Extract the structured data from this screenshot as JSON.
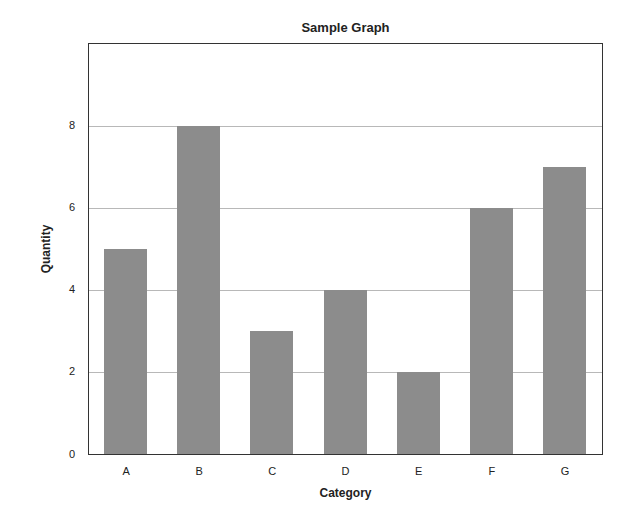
{
  "chart_data": {
    "type": "bar",
    "title": "Sample Graph",
    "xlabel": "Category",
    "ylabel": "Quantity",
    "categories": [
      "A",
      "B",
      "C",
      "D",
      "E",
      "F",
      "G"
    ],
    "values": [
      5,
      8,
      3,
      4,
      2,
      6,
      7
    ],
    "ylim": [
      0,
      10
    ],
    "yticks": [
      0,
      2,
      4,
      6,
      8
    ],
    "grid": true,
    "legend": null,
    "bar_color": "#8c8c8c"
  }
}
